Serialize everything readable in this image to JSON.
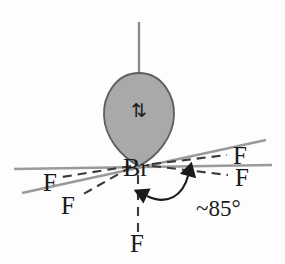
{
  "diagram": {
    "type": "vsepr-structure",
    "background_color": "#fdfdfd"
  },
  "center_atom": {
    "label": "Br",
    "name": "bromine-center",
    "x": 136,
    "y": 166,
    "color": "#1a1a1a"
  },
  "lone_pair": {
    "name": "lone-pair-lobe",
    "shape": "teardrop",
    "fill_color": "#a9a9a9",
    "stroke_color": "#595959",
    "electron_symbol": "⇅",
    "electron_symbol_name": "paired-electron-arrows",
    "electron_color": "#1a1a1a"
  },
  "ligands": [
    {
      "label": "F",
      "name": "fluorine-left-upper",
      "x": 50,
      "y": 182,
      "bond_style": "dashed",
      "bond_color": "#3a3a3a"
    },
    {
      "label": "F",
      "name": "fluorine-left-lower",
      "x": 65,
      "y": 203,
      "bond_style": "dashed",
      "bond_color": "#3a3a3a"
    },
    {
      "label": "F",
      "name": "fluorine-right-upper",
      "x": 238,
      "y": 160,
      "bond_style": "dashed",
      "bond_color": "#3a3a3a"
    },
    {
      "label": "F",
      "name": "fluorine-right-lower",
      "x": 240,
      "y": 180,
      "bond_style": "dashed",
      "bond_color": "#3a3a3a"
    },
    {
      "label": "F",
      "name": "fluorine-axial-bottom",
      "x": 136,
      "y": 247,
      "bond_style": "dashed",
      "bond_color": "#3a3a3a"
    }
  ],
  "axis_lines": [
    {
      "name": "axis-line-vertical-top",
      "color": "#8c8c8c"
    },
    {
      "name": "axis-line-horizontal",
      "color": "#8c8c8c"
    },
    {
      "name": "axis-line-diagonal",
      "color": "#8c8c8c"
    }
  ],
  "annotation": {
    "name": "bond-angle-annotation",
    "text": "~85°",
    "value": 85,
    "unit": "degrees",
    "approximate": true,
    "arrow_style": "double-headed-arc",
    "color": "#1a1a1a"
  }
}
